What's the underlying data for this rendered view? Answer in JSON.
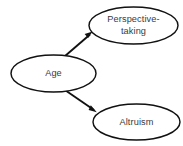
{
  "diagram": {
    "type": "path-diagram",
    "title": "",
    "background_color": "#ffffff",
    "node_fill_color": "#ffffff",
    "node_stroke_color": "#111111",
    "text_color": "#3a3a3a",
    "edge_color": "#111111",
    "nodes": [
      {
        "id": "perspective-taking",
        "shape": "ellipse",
        "label_line1": "Perspective-",
        "label_line2": "taking",
        "cx": 133.5,
        "cy": 25.5,
        "rx": 44.5,
        "ry": 18.5
      },
      {
        "id": "age",
        "shape": "ellipse",
        "label_line1": "Age",
        "label_line2": "",
        "cx": 53.5,
        "cy": 73.5,
        "rx": 42.5,
        "ry": 18.5
      },
      {
        "id": "altruism",
        "shape": "ellipse",
        "label_line1": "Altruism",
        "label_line2": "",
        "cx": 136.5,
        "cy": 122.0,
        "rx": 43.5,
        "ry": 18.0
      }
    ],
    "edges": [
      {
        "id": "age-to-perspective-taking",
        "from": "age",
        "to": "perspective-taking",
        "arrow": "single",
        "x1": 61.0,
        "y1": 59.5,
        "x2": 92.0,
        "y2": 32.5
      },
      {
        "id": "age-to-altruism",
        "from": "age",
        "to": "altruism",
        "arrow": "single",
        "x1": 62.0,
        "y1": 88.0,
        "x2": 96.0,
        "y2": 111.5
      }
    ]
  }
}
